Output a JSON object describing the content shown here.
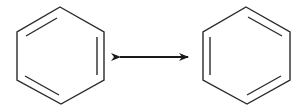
{
  "diagram": {
    "title": "Benzene resonance structures",
    "stroke_color": "#2a2a2a",
    "background": "#ffffff",
    "structures": [
      {
        "name": "Kekule structure A",
        "vertices": [
          [
            60,
            7
          ],
          [
            104,
            32
          ],
          [
            104,
            80
          ],
          [
            61,
            104
          ],
          [
            17,
            80
          ],
          [
            17,
            32
          ]
        ],
        "double_bonds": [
          "upper-left",
          "right",
          "lower-left"
        ]
      },
      {
        "name": "Kekule structure B",
        "vertices": [
          [
            246,
            7
          ],
          [
            290,
            32
          ],
          [
            290,
            80
          ],
          [
            247,
            104
          ],
          [
            203,
            80
          ],
          [
            203,
            32
          ]
        ],
        "double_bonds": [
          "upper-right",
          "left",
          "lower-right"
        ]
      }
    ],
    "arrow": {
      "type": "resonance double-headed arrow",
      "x1": 118,
      "x2": 190,
      "y": 57
    }
  }
}
